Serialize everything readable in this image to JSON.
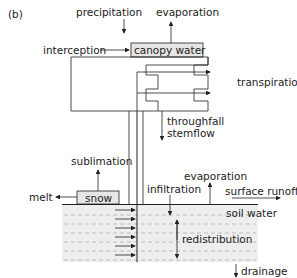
{
  "panel_label": "(b)",
  "labels": {
    "precipitation": "precipitation",
    "evaporation_canopy": "evaporation",
    "interception": "interception",
    "canopy_water": "canopy water",
    "transpiration": "transpiration",
    "throughfall": "throughfall",
    "stemflow": "stemflow",
    "sublimation": "sublimation",
    "melt": "melt",
    "snow": "snow",
    "infiltration": "infiltration",
    "evaporation_soil": "evaporation",
    "surface_runoff": "surface runoff",
    "soil_water": "soil water",
    "redistribution": "redistribution",
    "drainage": "drainage"
  },
  "colors": {
    "line": "#222222",
    "box_fill": "#e6e6e6",
    "soil_fill": "#eeeeee",
    "dash": "#b0b0b0"
  }
}
